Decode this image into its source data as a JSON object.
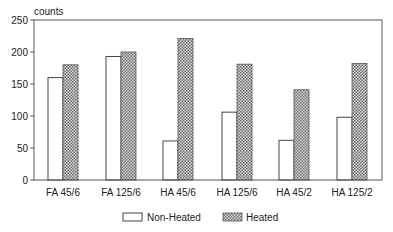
{
  "chart_data": {
    "type": "bar",
    "title": "",
    "xlabel": "",
    "ylabel": "counts",
    "ylim": [
      0,
      250
    ],
    "yticks": [
      0,
      50,
      100,
      150,
      200,
      250
    ],
    "grid": false,
    "legend_position": "bottom",
    "categories": [
      "FA 45/6",
      "FA 125/6",
      "HA 45/6",
      "HA 125/6",
      "HA 45/2",
      "HA 125/2"
    ],
    "series": [
      {
        "name": "Non-Heated",
        "fill": "white",
        "values": [
          160,
          193,
          61,
          106,
          62,
          98
        ]
      },
      {
        "name": "Heated",
        "fill": "crosshatch",
        "values": [
          180,
          200,
          221,
          181,
          141,
          182
        ]
      }
    ]
  },
  "legend": {
    "items": [
      {
        "label": "Non-Heated"
      },
      {
        "label": "Heated"
      }
    ]
  },
  "colors": {
    "frame": "#555555",
    "hatch_dark": "#6e6e6e",
    "hatch_light": "#d8d8d8",
    "bar_outline": "#444444"
  }
}
